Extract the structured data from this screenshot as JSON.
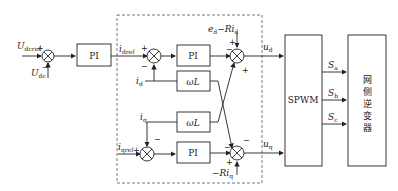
{
  "diagram": {
    "inputs": {
      "udcref": "U",
      "udcref_sub": "dcref",
      "udc": "U",
      "udc_sub": "dc",
      "idref": "i",
      "idref_sub": "dref",
      "iqref": "i",
      "iqref_sub": "qref",
      "id": "i",
      "id_sub": "d",
      "iq": "i",
      "iq_sub": "q",
      "ed_term": "e",
      "ed_sub": "d",
      "ed_rest": "−Ri",
      "ed_rest_sub": "d",
      "riq": "−Ri",
      "riq_sub": "q"
    },
    "blocks": {
      "pi_outer": "PI",
      "pi_d": "PI",
      "pi_q": "PI",
      "wl_top": "ωL",
      "wl_bottom": "ωL",
      "spwm": "SPWM",
      "inverter": [
        "网",
        "侧",
        "逆",
        "变",
        "器"
      ]
    },
    "outputs": {
      "ud": "u",
      "ud_sub": "d",
      "uq": "u",
      "uq_sub": "q",
      "sa": "S",
      "sa_sub": "a",
      "sb": "S",
      "sb_sub": "b",
      "sc": "S",
      "sc_sub": "c"
    },
    "signs": {
      "plus": "+",
      "minus": "−"
    }
  }
}
